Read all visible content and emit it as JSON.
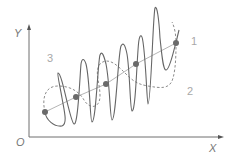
{
  "diagram": {
    "title": "",
    "axes": {
      "x_label": "X",
      "y_label": "Y",
      "origin_label": "O"
    },
    "curve_labels": {
      "trend": "1",
      "envelope": "2",
      "signal": "3"
    },
    "colors": {
      "axis": "#6e6e6e",
      "signal": "#666666",
      "envelope": "#8c8c8c",
      "trend": "#b0b0b0",
      "dots": "#666666",
      "labels": "#a0a0a0"
    },
    "series": [
      {
        "name": "trend line",
        "label": "1",
        "style": "solid thin light"
      },
      {
        "name": "envelope (slow oscillation)",
        "label": "2",
        "style": "dashed"
      },
      {
        "name": "signal (fast oscillation)",
        "label": "3",
        "style": "solid"
      }
    ],
    "sample_points": [
      {
        "x": 45,
        "y": 112
      },
      {
        "x": 76,
        "y": 97
      },
      {
        "x": 106,
        "y": 84
      },
      {
        "x": 136,
        "y": 64
      },
      {
        "x": 176,
        "y": 43
      }
    ]
  }
}
